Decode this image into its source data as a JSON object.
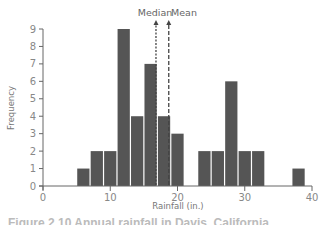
{
  "chart_data": {
    "type": "bar",
    "title": "",
    "xlabel": "Rainfall (in.)",
    "ylabel": "Frequency",
    "xlim": [
      0,
      40
    ],
    "ylim": [
      0,
      9
    ],
    "x_ticks": [
      0,
      10,
      20,
      30,
      40
    ],
    "y_ticks": [
      0,
      1,
      2,
      3,
      4,
      5,
      6,
      7,
      8,
      9
    ],
    "grid": false,
    "legend": null,
    "bin_width": 2,
    "bins": [
      {
        "start": 5,
        "end": 7,
        "count": 1
      },
      {
        "start": 7,
        "end": 9,
        "count": 2
      },
      {
        "start": 9,
        "end": 11,
        "count": 2
      },
      {
        "start": 11,
        "end": 13,
        "count": 9
      },
      {
        "start": 13,
        "end": 15,
        "count": 4
      },
      {
        "start": 15,
        "end": 17,
        "count": 7
      },
      {
        "start": 17,
        "end": 19,
        "count": 4
      },
      {
        "start": 19,
        "end": 21,
        "count": 3
      },
      {
        "start": 23,
        "end": 25,
        "count": 2
      },
      {
        "start": 25,
        "end": 27,
        "count": 2
      },
      {
        "start": 27,
        "end": 29,
        "count": 6
      },
      {
        "start": 29,
        "end": 31,
        "count": 2
      },
      {
        "start": 31,
        "end": 33,
        "count": 2
      },
      {
        "start": 37,
        "end": 39,
        "count": 1
      }
    ],
    "categories": [
      "5-7",
      "7-9",
      "9-11",
      "11-13",
      "13-15",
      "15-17",
      "17-19",
      "19-21",
      "23-25",
      "25-27",
      "27-29",
      "29-31",
      "31-33",
      "37-39"
    ],
    "values": [
      1,
      2,
      2,
      9,
      4,
      7,
      4,
      3,
      2,
      2,
      6,
      2,
      2,
      1
    ],
    "annotations": [
      {
        "label": "Median",
        "x": 16.8,
        "style": "dotted arrow"
      },
      {
        "label": "Mean",
        "x": 18.7,
        "style": "dashed arrow"
      }
    ],
    "bar_color": "#555555"
  },
  "labels": {
    "xlabel": "Rainfall (in.)",
    "ylabel": "Frequency",
    "median": "Median",
    "mean": "Mean",
    "caption": "Figure 2.10 Annual rainfall in Davis, California"
  }
}
